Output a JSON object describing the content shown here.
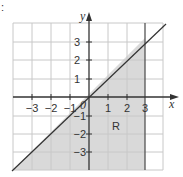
{
  "figure": {
    "corner_mark": ":",
    "axes": {
      "x_label": "x",
      "y_label": "y",
      "origin_label": "0",
      "x_ticks": [
        "−3",
        "−2",
        "−1",
        "1",
        "2",
        "3"
      ],
      "y_ticks": [
        "3",
        "2",
        "1",
        "−1",
        "−2",
        "−3"
      ],
      "grid_range": [
        -4,
        4
      ]
    },
    "region": {
      "label": "R",
      "description": "Shaded region below line y = x and to the left of x = 3",
      "fill_color": "#d9d9d9"
    },
    "lines": [
      {
        "name": "y = x",
        "type": "diagonal"
      },
      {
        "name": "x = 3",
        "type": "vertical"
      }
    ],
    "colors": {
      "grid": "#c8c8c8",
      "axis": "#333333",
      "shade": "#d9d9d9"
    }
  }
}
